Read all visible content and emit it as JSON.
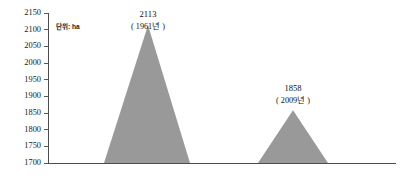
{
  "chart_data": {
    "type": "area",
    "title": "",
    "subtitle": "",
    "xlabel": "",
    "ylabel": "",
    "unit_note": "단위: ha",
    "ylim": [
      1700,
      2150
    ],
    "yticks": [
      2150,
      2100,
      2050,
      2000,
      1950,
      1900,
      1850,
      1800,
      1750,
      1700
    ],
    "ytick_labels": [
      "2150",
      "2100",
      "2050",
      "2000",
      "1950",
      "1900",
      "1850",
      "1800",
      "1750",
      "1700"
    ],
    "grid": false,
    "legend": "none",
    "xaxis_visible_ticks": false,
    "series": [
      {
        "name": "면적",
        "color": "#999999",
        "points": [
          {
            "label": "1961년",
            "value": 2113,
            "value_text": "2113",
            "year_text": "( 1961년 )"
          },
          {
            "label": "2009년",
            "value": 1858,
            "value_text": "1858",
            "year_text": "( 2009년 )"
          }
        ]
      }
    ],
    "peaks": [
      {
        "value_text": "2113",
        "year_text": "( 1961년 )",
        "value": 2113,
        "apex_x": 148,
        "base_left_x": 104,
        "base_right_x": 190,
        "label_x": 148,
        "value_label_y": 15,
        "year_label_y": 27
      },
      {
        "value_text": "1858",
        "year_text": "( 2009년 )",
        "value": 1858,
        "apex_x": 293,
        "base_left_x": 258,
        "base_right_x": 328,
        "label_x": 293,
        "value_label_y": 89,
        "year_label_y": 101
      }
    ]
  },
  "axes": {
    "y_axis_x": 48,
    "baseline_y": 163,
    "top_y": 13,
    "baseline_right_x": 396,
    "tick_length": 4,
    "unit_note_x": 56,
    "unit_note_y": 27
  },
  "colors": {
    "series_fill": "#999999",
    "axis": "#4d4d4d",
    "text": "#111111",
    "background": "#ffffff"
  }
}
